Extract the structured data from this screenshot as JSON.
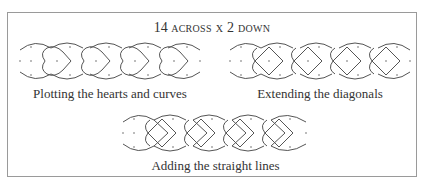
{
  "figure": {
    "title_number": "14",
    "title_words": "across x 2 down",
    "panels": [
      {
        "id": "hearts",
        "caption": "Plotting the hearts and curves"
      },
      {
        "id": "diagonals",
        "caption": "Extending the diagonals"
      },
      {
        "id": "straight",
        "caption": "Adding the straight lines"
      }
    ],
    "grid": {
      "across": 14,
      "down": 2
    },
    "colors": {
      "line": "#555555",
      "frame": "#9a9a9a",
      "dot": "#666666"
    }
  }
}
